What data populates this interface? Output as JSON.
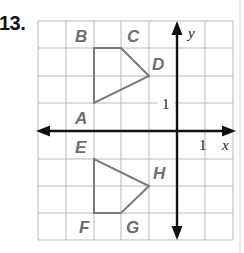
{
  "problem": {
    "number": "13."
  },
  "graph": {
    "grid": {
      "cols": 7,
      "rows": 8,
      "origin_col": 5,
      "origin_row": 4,
      "line_color": "#b9b9b9"
    },
    "axes": {
      "x_label": "x",
      "y_label": "y",
      "x_tick_label": "1",
      "y_tick_label": "1"
    },
    "figures": [
      {
        "name": "ABCD",
        "vertices": [
          {
            "label": "A",
            "x": -3,
            "y": 1
          },
          {
            "label": "B",
            "x": -3,
            "y": 3
          },
          {
            "label": "C",
            "x": -2,
            "y": 3
          },
          {
            "label": "D",
            "x": -1,
            "y": 2
          }
        ]
      },
      {
        "name": "EFGH",
        "vertices": [
          {
            "label": "E",
            "x": -3,
            "y": -1
          },
          {
            "label": "F",
            "x": -3,
            "y": -3
          },
          {
            "label": "G",
            "x": -2,
            "y": -3
          },
          {
            "label": "H",
            "x": -1,
            "y": -2
          }
        ]
      }
    ],
    "shape_color": "#7a7a7a",
    "label_color": "#6e6e6e"
  }
}
